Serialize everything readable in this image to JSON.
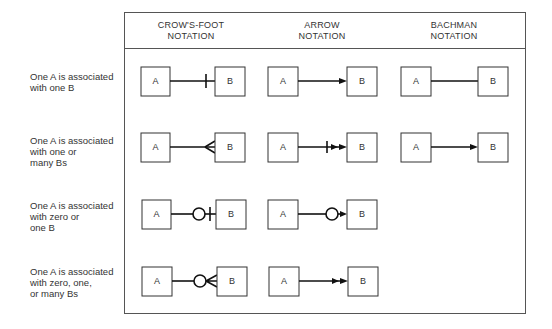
{
  "columns": [
    {
      "id": "crows-foot",
      "title_line1": "CROW'S-FOOT",
      "title_line2": "NOTATION"
    },
    {
      "id": "arrow",
      "title_line1": "ARROW",
      "title_line2": "NOTATION"
    },
    {
      "id": "bachman",
      "title_line1": "BACHMAN",
      "title_line2": "NOTATION"
    }
  ],
  "rows": [
    {
      "lines": [
        "One A is associated",
        "with one B"
      ],
      "crows_foot": "one",
      "arrow": "single-arrow",
      "bachman": "plain-line"
    },
    {
      "lines": [
        "One A is associated",
        "with one or",
        "many Bs"
      ],
      "crows_foot": "one-or-many",
      "arrow": "tick-double-arrow",
      "bachman": "single-arrow"
    },
    {
      "lines": [
        "One A is associated",
        "with zero or",
        "one B"
      ],
      "crows_foot": "zero-or-one",
      "arrow": "circle-single-arrow",
      "bachman": null
    },
    {
      "lines": [
        "One A is associated",
        "with zero, one,",
        "or many Bs"
      ],
      "crows_foot": "zero-one-or-many",
      "arrow": "double-arrow",
      "bachman": null
    }
  ],
  "entity_labels": {
    "a": "A",
    "b": "B"
  },
  "colors": {
    "line": "#111111",
    "border": "#555555",
    "text": "#333333"
  }
}
